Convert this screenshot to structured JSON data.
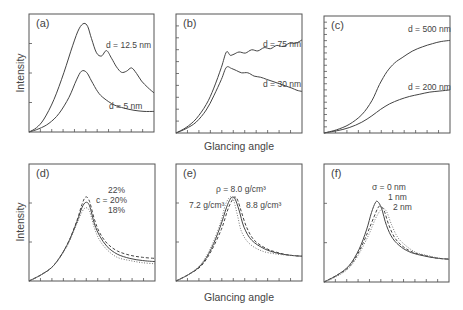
{
  "figure": {
    "xlabel_top": "Glancing angle",
    "xlabel_bottom": "Glancing angle",
    "ylabel_top": "Intensity",
    "ylabel_bottom": "Intensity"
  },
  "chart_data": [
    {
      "id": "a",
      "type": "line",
      "panel_label": "(a)",
      "xlabel": "Glancing angle",
      "ylabel": "Intensity",
      "frame": [
        29,
        14,
        154,
        132
      ],
      "x_ticks": 11,
      "y_ticks": 3,
      "series": [
        {
          "name": "d = 12.5 nm",
          "style": "solid",
          "x": [
            0,
            0.06,
            0.12,
            0.2,
            0.28,
            0.35,
            0.4,
            0.44,
            0.47,
            0.5,
            0.54,
            0.58,
            0.62,
            0.66,
            0.7,
            0.74,
            0.78,
            0.82,
            0.86,
            0.9,
            0.95,
            1.0
          ],
          "y": [
            0,
            0.04,
            0.12,
            0.3,
            0.55,
            0.8,
            0.95,
            1.0,
            0.97,
            0.86,
            0.73,
            0.7,
            0.75,
            0.68,
            0.6,
            0.55,
            0.56,
            0.59,
            0.54,
            0.47,
            0.41,
            0.36
          ]
        },
        {
          "name": "d = 5 nm",
          "style": "solid",
          "x": [
            0,
            0.08,
            0.16,
            0.24,
            0.32,
            0.38,
            0.42,
            0.46,
            0.5,
            0.55,
            0.6,
            0.68,
            0.76,
            0.84,
            0.92,
            1.0
          ],
          "y": [
            0,
            0.03,
            0.08,
            0.17,
            0.32,
            0.48,
            0.56,
            0.55,
            0.47,
            0.37,
            0.31,
            0.25,
            0.22,
            0.2,
            0.19,
            0.19
          ]
        }
      ],
      "annotations": [
        {
          "text": "d = 12.5 nm",
          "x": 106,
          "y": 48
        },
        {
          "text": "d = 5 nm",
          "x": 109,
          "y": 109
        }
      ]
    },
    {
      "id": "b",
      "type": "line",
      "panel_label": "(b)",
      "xlabel": "Glancing angle",
      "ylabel": "Intensity",
      "frame": [
        176,
        14,
        302,
        133
      ],
      "x_ticks": 11,
      "y_ticks": 9,
      "series": [
        {
          "name": "d = 75 nm",
          "style": "solid",
          "x": [
            0,
            0.08,
            0.16,
            0.24,
            0.3,
            0.36,
            0.4,
            0.43,
            0.46,
            0.5,
            0.55,
            0.6,
            0.65,
            0.7,
            0.75,
            0.8,
            0.85,
            0.9,
            0.95,
            1.0
          ],
          "y": [
            0,
            0.05,
            0.13,
            0.26,
            0.41,
            0.6,
            0.74,
            0.71,
            0.72,
            0.74,
            0.73,
            0.76,
            0.75,
            0.78,
            0.77,
            0.8,
            0.79,
            0.82,
            0.82,
            0.85
          ]
        },
        {
          "name": "d = 30 nm",
          "style": "solid",
          "x": [
            0,
            0.08,
            0.16,
            0.24,
            0.3,
            0.36,
            0.4,
            0.44,
            0.48,
            0.52,
            0.57,
            0.62,
            0.67,
            0.72,
            0.77,
            0.82,
            0.87,
            0.92,
            0.96,
            1.0
          ],
          "y": [
            0,
            0.04,
            0.1,
            0.21,
            0.34,
            0.49,
            0.6,
            0.59,
            0.57,
            0.55,
            0.55,
            0.52,
            0.51,
            0.49,
            0.47,
            0.45,
            0.43,
            0.41,
            0.39,
            0.38
          ]
        }
      ],
      "annotations": [
        {
          "text": "d = 75 nm",
          "x": 263,
          "y": 47
        },
        {
          "text": "d = 30 nm",
          "x": 263,
          "y": 87
        }
      ]
    },
    {
      "id": "c",
      "type": "line",
      "panel_label": "(c)",
      "xlabel": "Glancing angle",
      "ylabel": "Intensity",
      "frame": [
        324,
        16,
        450,
        133
      ],
      "x_ticks": 11,
      "y_ticks": 18,
      "series": [
        {
          "name": "d = 500 nm",
          "style": "solid",
          "x": [
            0,
            0.1,
            0.2,
            0.3,
            0.38,
            0.44,
            0.5,
            0.56,
            0.62,
            0.7,
            0.78,
            0.86,
            0.93,
            1.0
          ],
          "y": [
            0,
            0.03,
            0.08,
            0.17,
            0.3,
            0.45,
            0.57,
            0.65,
            0.7,
            0.76,
            0.8,
            0.83,
            0.85,
            0.86
          ]
        },
        {
          "name": "d = 200 nm",
          "style": "solid",
          "x": [
            0,
            0.1,
            0.2,
            0.3,
            0.38,
            0.45,
            0.52,
            0.6,
            0.68,
            0.76,
            0.84,
            0.92,
            1.0
          ],
          "y": [
            0,
            0.02,
            0.05,
            0.1,
            0.16,
            0.22,
            0.27,
            0.31,
            0.34,
            0.36,
            0.38,
            0.39,
            0.4
          ]
        }
      ],
      "annotations": [
        {
          "text": "d = 500 nm",
          "x": 408,
          "y": 32
        },
        {
          "text": "d = 200 nm",
          "x": 408,
          "y": 90
        }
      ]
    },
    {
      "id": "d",
      "type": "line",
      "panel_label": "(d)",
      "xlabel": "Glancing angle",
      "ylabel": "Intensity",
      "frame": [
        29,
        164,
        155,
        281
      ],
      "x_ticks": 11,
      "y_ticks": 2,
      "series": [
        {
          "name": "c = 22%",
          "style": "dashed",
          "x": [
            0,
            0.1,
            0.2,
            0.3,
            0.38,
            0.42,
            0.45,
            0.48,
            0.52,
            0.56,
            0.62,
            0.7,
            0.8,
            0.9,
            1.0
          ],
          "y": [
            0,
            0.06,
            0.15,
            0.33,
            0.56,
            0.71,
            0.78,
            0.74,
            0.57,
            0.45,
            0.35,
            0.28,
            0.24,
            0.22,
            0.21
          ]
        },
        {
          "name": "c = 20%",
          "style": "solid",
          "x": [
            0,
            0.1,
            0.2,
            0.3,
            0.38,
            0.42,
            0.45,
            0.48,
            0.52,
            0.56,
            0.62,
            0.7,
            0.8,
            0.9,
            1.0
          ],
          "y": [
            0,
            0.06,
            0.15,
            0.33,
            0.55,
            0.68,
            0.73,
            0.7,
            0.53,
            0.42,
            0.32,
            0.25,
            0.21,
            0.19,
            0.18
          ]
        },
        {
          "name": "c = 18%",
          "style": "dotted",
          "x": [
            0,
            0.1,
            0.2,
            0.3,
            0.38,
            0.42,
            0.45,
            0.48,
            0.52,
            0.56,
            0.62,
            0.7,
            0.8,
            0.9,
            1.0
          ],
          "y": [
            0,
            0.06,
            0.15,
            0.32,
            0.53,
            0.64,
            0.68,
            0.65,
            0.49,
            0.38,
            0.29,
            0.22,
            0.19,
            0.17,
            0.16
          ]
        }
      ],
      "annotations": [
        {
          "text": "22%",
          "x": 108,
          "y": 193
        },
        {
          "text": "c = 20%",
          "x": 96,
          "y": 203
        },
        {
          "text": "18%",
          "x": 108,
          "y": 213
        }
      ]
    },
    {
      "id": "e",
      "type": "line",
      "panel_label": "(e)",
      "xlabel": "Glancing angle",
      "ylabel": "Intensity",
      "frame": [
        176,
        164,
        302,
        281
      ],
      "x_ticks": 11,
      "y_ticks": 2,
      "series": [
        {
          "name": "ρ = 8.0 g/cm³",
          "style": "solid",
          "x": [
            0,
            0.1,
            0.2,
            0.28,
            0.35,
            0.4,
            0.43,
            0.45,
            0.47,
            0.5,
            0.54,
            0.6,
            0.7,
            0.8,
            0.9,
            1.0
          ],
          "y": [
            0,
            0.06,
            0.15,
            0.3,
            0.5,
            0.68,
            0.76,
            0.78,
            0.76,
            0.66,
            0.5,
            0.38,
            0.3,
            0.26,
            0.24,
            0.23
          ]
        },
        {
          "name": "7.2 g/cm³",
          "style": "dashed",
          "x": [
            0,
            0.1,
            0.2,
            0.28,
            0.36,
            0.41,
            0.45,
            0.47,
            0.49,
            0.52,
            0.56,
            0.62,
            0.72,
            0.82,
            0.9,
            1.0
          ],
          "y": [
            0,
            0.06,
            0.14,
            0.28,
            0.48,
            0.66,
            0.76,
            0.78,
            0.75,
            0.64,
            0.5,
            0.38,
            0.3,
            0.26,
            0.24,
            0.23
          ]
        },
        {
          "name": "8.8 g/cm³",
          "style": "dotted",
          "x": [
            0,
            0.1,
            0.2,
            0.28,
            0.35,
            0.39,
            0.42,
            0.44,
            0.46,
            0.49,
            0.52,
            0.58,
            0.68,
            0.8,
            0.9,
            1.0
          ],
          "y": [
            0,
            0.06,
            0.16,
            0.32,
            0.53,
            0.7,
            0.77,
            0.78,
            0.74,
            0.6,
            0.46,
            0.35,
            0.28,
            0.25,
            0.24,
            0.23
          ]
        }
      ],
      "annotations": [
        {
          "text": "ρ = 8.0 g/cm³",
          "x": 216,
          "y": 192
        },
        {
          "text": "7.2 g/cm³",
          "x": 189,
          "y": 208
        },
        {
          "text": "8.8 g/cm³",
          "x": 246,
          "y": 208
        }
      ]
    },
    {
      "id": "f",
      "type": "line",
      "panel_label": "(f)",
      "xlabel": "Glancing angle",
      "ylabel": "Intensity",
      "frame": [
        324,
        164,
        449,
        282
      ],
      "x_ticks": 11,
      "y_ticks": 2,
      "series": [
        {
          "name": "σ = 0 nm",
          "style": "solid",
          "x": [
            0,
            0.1,
            0.2,
            0.28,
            0.34,
            0.38,
            0.41,
            0.43,
            0.46,
            0.5,
            0.55,
            0.62,
            0.7,
            0.8,
            0.9,
            1.0
          ],
          "y": [
            0,
            0.06,
            0.15,
            0.3,
            0.48,
            0.64,
            0.73,
            0.74,
            0.68,
            0.52,
            0.4,
            0.32,
            0.27,
            0.24,
            0.22,
            0.21
          ]
        },
        {
          "name": "1 nm",
          "style": "dashed",
          "x": [
            0,
            0.1,
            0.2,
            0.28,
            0.35,
            0.4,
            0.43,
            0.45,
            0.48,
            0.52,
            0.57,
            0.64,
            0.72,
            0.82,
            0.9,
            1.0
          ],
          "y": [
            0,
            0.06,
            0.14,
            0.28,
            0.46,
            0.6,
            0.68,
            0.7,
            0.66,
            0.52,
            0.4,
            0.32,
            0.27,
            0.24,
            0.22,
            0.21
          ]
        },
        {
          "name": "2 nm",
          "style": "dotted",
          "x": [
            0,
            0.1,
            0.2,
            0.28,
            0.36,
            0.41,
            0.45,
            0.47,
            0.5,
            0.54,
            0.59,
            0.66,
            0.74,
            0.84,
            0.92,
            1.0
          ],
          "y": [
            0,
            0.05,
            0.13,
            0.26,
            0.44,
            0.58,
            0.66,
            0.68,
            0.65,
            0.53,
            0.41,
            0.33,
            0.27,
            0.24,
            0.22,
            0.21
          ]
        }
      ],
      "annotations": [
        {
          "text": "σ = 0 nm",
          "x": 372,
          "y": 190
        },
        {
          "text": "1 nm",
          "x": 388,
          "y": 200
        },
        {
          "text": "2 nm",
          "x": 393,
          "y": 210
        }
      ]
    }
  ]
}
